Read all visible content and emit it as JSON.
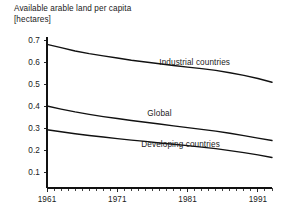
{
  "chart_data": {
    "type": "line",
    "title": "Available arable land per capita",
    "subtitle": "[hectares]",
    "xlabel": "",
    "ylabel": "",
    "xlim": [
      1961,
      1993
    ],
    "ylim": [
      0.05,
      0.72
    ],
    "grid": false,
    "legend_position": "inline-labels",
    "y_ticks": [
      "0.7",
      "0.6",
      "0.5",
      "0.4",
      "0.3",
      "0.2",
      "0.1"
    ],
    "y_tick_values": [
      0.7,
      0.6,
      0.5,
      0.4,
      0.3,
      0.2,
      0.1
    ],
    "x_ticks": [
      "1961",
      "1971",
      "1981",
      "1991"
    ],
    "x_tick_values": [
      1961,
      1971,
      1981,
      1991
    ],
    "x_minor_tick_interval": 1,
    "x": [
      1961,
      1963,
      1965,
      1967,
      1969,
      1971,
      1973,
      1975,
      1977,
      1979,
      1981,
      1983,
      1985,
      1987,
      1989,
      1991,
      1993
    ],
    "series": [
      {
        "name": "Industrial countries",
        "label": "Industrial countries",
        "color": "#111111",
        "values": [
          0.68,
          0.665,
          0.65,
          0.638,
          0.628,
          0.618,
          0.608,
          0.6,
          0.592,
          0.584,
          0.577,
          0.57,
          0.562,
          0.551,
          0.539,
          0.525,
          0.508
        ]
      },
      {
        "name": "Global",
        "label": "Global",
        "color": "#111111",
        "values": [
          0.4,
          0.386,
          0.373,
          0.362,
          0.352,
          0.343,
          0.334,
          0.326,
          0.318,
          0.31,
          0.302,
          0.294,
          0.286,
          0.276,
          0.265,
          0.254,
          0.243
        ]
      },
      {
        "name": "Developing countries",
        "label": "Developing countries",
        "color": "#111111",
        "values": [
          0.292,
          0.283,
          0.274,
          0.266,
          0.259,
          0.252,
          0.245,
          0.239,
          0.232,
          0.226,
          0.22,
          0.213,
          0.206,
          0.197,
          0.188,
          0.178,
          0.166
        ]
      }
    ],
    "annotations": [
      {
        "text": "Industrial countries",
        "x": 1982,
        "y": 0.585
      },
      {
        "text": "Global",
        "x": 1977,
        "y": 0.355
      },
      {
        "text": "Developing countries",
        "x": 1980,
        "y": 0.215
      }
    ]
  }
}
